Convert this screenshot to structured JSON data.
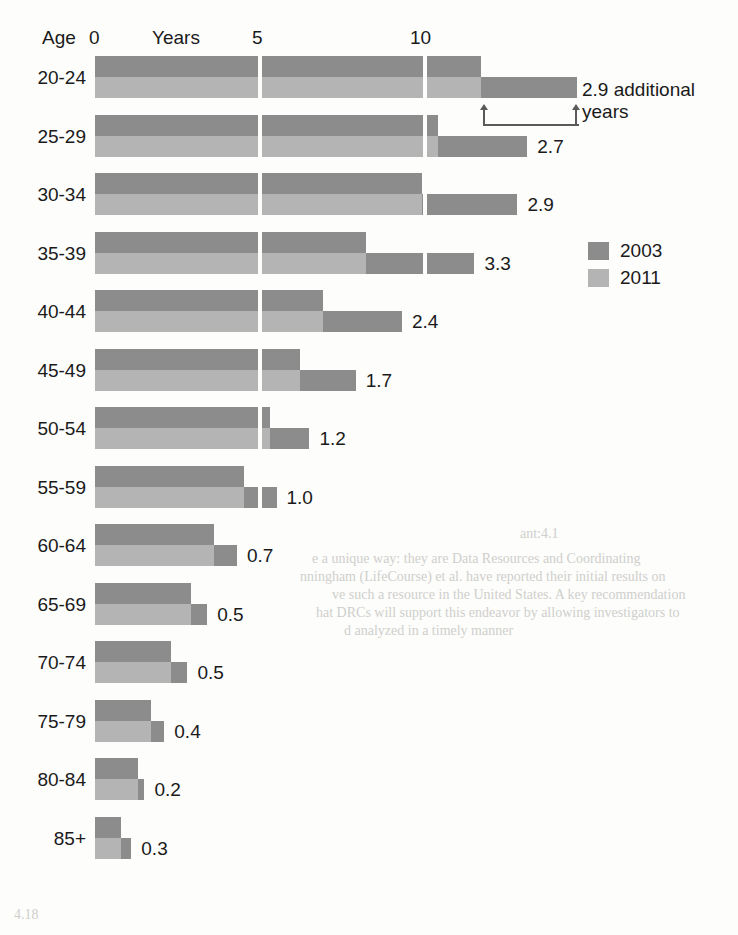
{
  "axis": {
    "age_label": "Age",
    "unit_label": "Years",
    "ticks": [
      "0",
      "5",
      "10"
    ],
    "tick_values": [
      0,
      5,
      10
    ]
  },
  "legend": {
    "items": [
      {
        "label": "2003",
        "color": "#8c8c8c"
      },
      {
        "label": "2011",
        "color": "#b4b4b4"
      }
    ]
  },
  "callout": {
    "line1": "2.9 additional",
    "line2": "years"
  },
  "chart_data": {
    "type": "bar",
    "title": "",
    "xlabel": "Years",
    "ylabel": "Age",
    "xlim": [
      0,
      15
    ],
    "grid": true,
    "gridlines": [
      5,
      10
    ],
    "legend_position": "right",
    "orientation": "horizontal",
    "categories": [
      "20-24",
      "25-29",
      "30-34",
      "35-39",
      "40-44",
      "45-49",
      "50-54",
      "55-59",
      "60-64",
      "65-69",
      "70-74",
      "75-79",
      "80-84",
      "85+"
    ],
    "series": [
      {
        "name": "2003",
        "values": [
          11.7,
          10.4,
          9.9,
          8.2,
          6.9,
          6.2,
          5.3,
          4.5,
          3.6,
          2.9,
          2.3,
          1.7,
          1.3,
          0.8
        ]
      },
      {
        "name": "2011",
        "values": [
          14.6,
          13.1,
          12.8,
          11.5,
          9.3,
          7.9,
          6.5,
          5.5,
          4.3,
          3.4,
          2.8,
          2.1,
          1.5,
          1.1
        ]
      }
    ],
    "additional_years": [
      2.9,
      2.7,
      2.9,
      3.3,
      2.4,
      1.7,
      1.2,
      1.0,
      0.7,
      0.5,
      0.5,
      0.4,
      0.2,
      0.3
    ],
    "data_labels": [
      "2.9",
      "2.7",
      "2.9",
      "3.3",
      "2.4",
      "1.7",
      "1.2",
      "1.0",
      "0.7",
      "0.5",
      "0.5",
      "0.4",
      "0.2",
      "0.3"
    ],
    "annotation": "2.9 additional years"
  },
  "bleed": {
    "l1": "ant:4.1",
    "l2": "e a unique way: they are Data Resources and Coordinating",
    "l3": "nningham (LifeCourse) et al. have reported their initial results on",
    "l4": "ve such a resource in the United States. A key recommendation",
    "l5": "hat DRCs will support this endeavor by allowing investigators to",
    "l6": "d analyzed in a timely manner",
    "l7": "4.18"
  }
}
